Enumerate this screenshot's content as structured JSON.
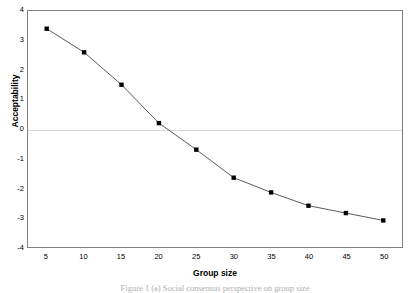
{
  "chart_data": {
    "type": "line",
    "title": "",
    "xlabel": "Group size",
    "ylabel": "Acceptability",
    "x": [
      5,
      10,
      15,
      20,
      25,
      30,
      35,
      40,
      45,
      50
    ],
    "values": [
      3.4,
      2.6,
      1.5,
      0.2,
      -0.7,
      -1.65,
      -2.15,
      -2.6,
      -2.85,
      -3.1
    ],
    "series": [
      {
        "name": "Acceptability",
        "values": [
          3.4,
          2.6,
          1.5,
          0.2,
          -0.7,
          -1.65,
          -2.15,
          -2.6,
          -2.85,
          -3.1
        ]
      }
    ],
    "xlim": [
      2.5,
      52.5
    ],
    "ylim": [
      -4,
      4
    ],
    "xticks": [
      "5",
      "10",
      "15",
      "20",
      "25",
      "30",
      "35",
      "40",
      "45",
      "50"
    ],
    "yticks": [
      "4",
      "3",
      "2",
      "1",
      "0",
      "-1",
      "-2",
      "-3",
      "-4"
    ],
    "ytick_values": [
      4,
      3,
      2,
      1,
      0,
      -1,
      -2,
      -3,
      -4
    ],
    "grid": "zero-line-only",
    "legend": "none",
    "marker": "square",
    "marker_color": "#000000",
    "line_color": "#595959",
    "gridline_color": "#d9d9d9",
    "frame_color": "#808080"
  },
  "caption": {
    "text": "Figure 1 (a) Social consensus perspective on group size"
  }
}
